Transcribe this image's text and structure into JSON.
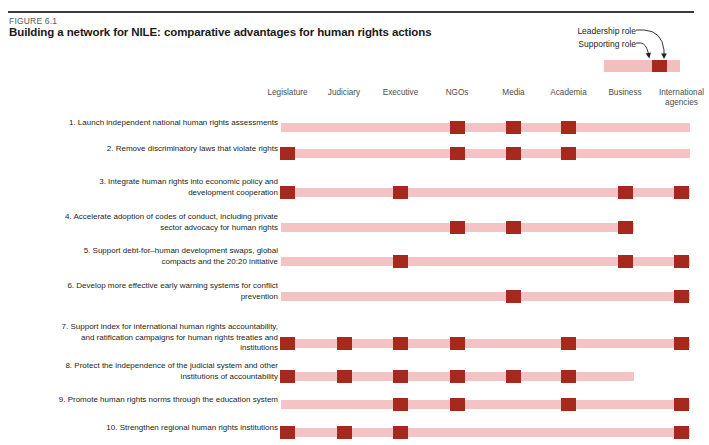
{
  "figure": {
    "number": "FIGURE 6.1",
    "title": "Building a network for NILE: comparative advantages for human rights actions"
  },
  "legend": {
    "leadership_label": "Leadership role",
    "supporting_label": "Supporting role",
    "leadership_color": "#a5291d",
    "supporting_color": "#f4c3c3"
  },
  "chart_data": {
    "type": "heatmap",
    "title": "Building a network for NILE: comparative advantages for human rights actions",
    "xlabel": "",
    "ylabel": "",
    "legend_position": "top-right",
    "grid": false,
    "value_meanings": {
      "0": "no role",
      "1": "Supporting role",
      "2": "Leadership role"
    },
    "categories": [
      "Legislature",
      "Judiciary",
      "Executive",
      "NGOs",
      "Media",
      "Academia",
      "Business",
      "International agencies"
    ],
    "rows": [
      {
        "label": "1. Launch independent national human rights assessments",
        "values": [
          1,
          1,
          1,
          2,
          2,
          2,
          1,
          1
        ]
      },
      {
        "label": "2. Remove discriminatory laws that violate rights",
        "values": [
          2,
          1,
          1,
          2,
          2,
          2,
          1,
          1
        ]
      },
      {
        "label": "3. Integrate human rights into economic policy and development cooperation",
        "values": [
          2,
          1,
          2,
          1,
          1,
          1,
          2,
          2
        ]
      },
      {
        "label": "4. Accelerate adoption of codes of conduct, including private sector advocacy for human rights",
        "values": [
          1,
          1,
          1,
          2,
          2,
          1,
          2,
          0
        ]
      },
      {
        "label": "5. Support debt-for–human development swaps, global compacts and the 20:20 initiative",
        "values": [
          1,
          1,
          2,
          1,
          1,
          1,
          2,
          2
        ]
      },
      {
        "label": "6. Develop more effective early warning systems for conflict prevention",
        "values": [
          1,
          1,
          1,
          1,
          2,
          1,
          1,
          2
        ]
      },
      {
        "label": "7. Support index for international human rights accountability, and ratification campaigns for human rights treaties and institutions",
        "values": [
          2,
          2,
          2,
          2,
          1,
          2,
          1,
          2
        ]
      },
      {
        "label": "8. Protect the independence of the judicial system and other institutions of accountability",
        "values": [
          2,
          2,
          2,
          2,
          2,
          2,
          1,
          0
        ]
      },
      {
        "label": "9. Promote human rights norms through the education system",
        "values": [
          1,
          1,
          2,
          2,
          1,
          2,
          1,
          2
        ]
      },
      {
        "label": "10. Strengthen regional human rights institutions",
        "values": [
          2,
          2,
          2,
          1,
          1,
          1,
          1,
          2
        ]
      }
    ]
  }
}
